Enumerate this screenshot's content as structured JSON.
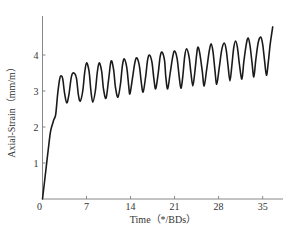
{
  "chart_data": {
    "type": "line",
    "title": "",
    "xlabel": "Time (*/BDs)",
    "ylabel": "Axial-Strain (mm/m)",
    "xlim": [
      0,
      38
    ],
    "ylim": [
      0,
      5
    ],
    "xticks": [
      0,
      7,
      14,
      21,
      28,
      35
    ],
    "yticks": [
      1,
      2,
      3,
      4
    ],
    "origin_label": "0",
    "grid": false,
    "legend": null,
    "series": [
      {
        "name": "Axial-Strain",
        "color": "#1a1a1a",
        "x": [
          0,
          0.5,
          1.0,
          1.3,
          1.8,
          2.1,
          2.4,
          2.7,
          2.9,
          3.2,
          3.5,
          3.85,
          4.2,
          4.6,
          5.0,
          5.4,
          5.7,
          6.0,
          6.4,
          6.7,
          7.0,
          7.4,
          7.7,
          8.0,
          8.4,
          8.7,
          9.0,
          9.4,
          9.7,
          10.1,
          10.5,
          10.9,
          11.3,
          11.6,
          12.0,
          12.4,
          12.7,
          13.0,
          13.4,
          13.7,
          13.9,
          14.3,
          14.7,
          15.0,
          15.4,
          15.7,
          16.0,
          16.4,
          16.7,
          17.0,
          17.4,
          17.7,
          18.0,
          18.4,
          18.7,
          19.0,
          19.4,
          19.6,
          19.9,
          20.3,
          20.7,
          21.0,
          21.4,
          21.7,
          22.0,
          22.3,
          22.6,
          22.9,
          23.3,
          23.6,
          23.9,
          24.2,
          24.5,
          24.7,
          25.0,
          25.4,
          25.7,
          26.1,
          26.5,
          26.8,
          27.1,
          27.4,
          27.7,
          28.1,
          28.5,
          28.9,
          29.2,
          29.5,
          29.8,
          30.1,
          30.4,
          30.7,
          31.0,
          31.3,
          31.7,
          32.0,
          32.4,
          32.7,
          33.0,
          33.3,
          33.6,
          33.9,
          34.3,
          34.7,
          35.0,
          35.3,
          35.6,
          35.9,
          36.2,
          36.6
        ],
        "y": [
          0,
          0.75,
          1.5,
          1.9,
          2.2,
          2.35,
          2.9,
          3.3,
          3.42,
          3.35,
          2.95,
          2.67,
          2.9,
          3.4,
          3.5,
          3.35,
          2.9,
          2.72,
          3.0,
          3.5,
          3.78,
          3.55,
          3.0,
          2.69,
          3.0,
          3.5,
          3.78,
          3.55,
          3.05,
          2.8,
          3.3,
          3.83,
          3.6,
          3.1,
          2.83,
          3.2,
          3.7,
          3.89,
          3.65,
          3.15,
          2.92,
          3.35,
          3.8,
          3.92,
          3.7,
          3.25,
          2.97,
          3.4,
          3.85,
          4.0,
          3.8,
          3.35,
          3.06,
          3.5,
          3.95,
          4.08,
          3.85,
          3.4,
          3.06,
          3.5,
          3.95,
          4.11,
          3.9,
          3.45,
          3.08,
          3.4,
          3.95,
          4.17,
          3.95,
          3.5,
          3.14,
          3.5,
          4.0,
          4.22,
          4.05,
          3.55,
          3.14,
          3.6,
          4.1,
          4.31,
          4.1,
          3.6,
          3.19,
          3.65,
          4.15,
          4.33,
          4.15,
          3.7,
          3.28,
          3.7,
          4.2,
          4.39,
          4.2,
          3.75,
          3.33,
          3.8,
          4.3,
          4.47,
          4.25,
          3.8,
          3.39,
          3.85,
          4.35,
          4.5,
          4.3,
          3.85,
          3.44,
          3.8,
          4.3,
          4.78
        ]
      }
    ]
  },
  "plot": {
    "origin_px": [
      42.5,
      199
    ],
    "px_per_x": 6.29,
    "px_per_y": 36,
    "x_axis_end_px": 283,
    "y_axis_top_px": 16,
    "axis_color": "#888888",
    "tick_len": 3
  },
  "labels": {
    "xlabel": "Time（*/BDs）",
    "ylabel": "Axial-Strain（mm/m）"
  }
}
